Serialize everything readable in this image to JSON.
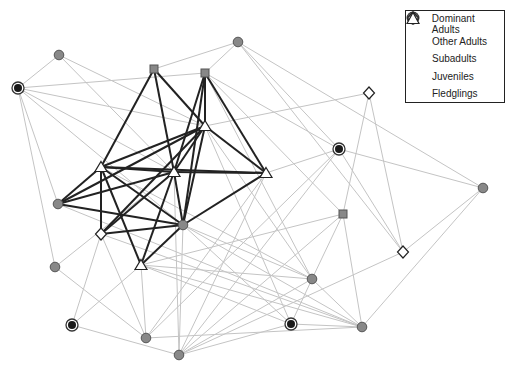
{
  "legend": {
    "items": [
      {
        "label": "Dominant Adults",
        "type": "dominant"
      },
      {
        "label": "Other Adults",
        "type": "adult"
      },
      {
        "label": "Subadults",
        "type": "subadult"
      },
      {
        "label": "Juveniles",
        "type": "juvenile"
      },
      {
        "label": "Fledglings",
        "type": "fledgling"
      }
    ]
  },
  "colors": {
    "node_fill": "#888888",
    "node_stroke": "#555555",
    "dominant_core": "#1a1a1a",
    "strong_edge": "#222222",
    "weak_edge": "#c4c4c4"
  },
  "nodes": [
    {
      "id": "A1",
      "type": "adult",
      "x": 59,
      "y": 55
    },
    {
      "id": "D1",
      "type": "dominant",
      "x": 18,
      "y": 88
    },
    {
      "id": "S1",
      "type": "subadult",
      "x": 154,
      "y": 69
    },
    {
      "id": "S2",
      "type": "subadult",
      "x": 205,
      "y": 73
    },
    {
      "id": "A2",
      "type": "adult",
      "x": 238,
      "y": 42
    },
    {
      "id": "F1",
      "type": "fledgling",
      "x": 205,
      "y": 126
    },
    {
      "id": "F2",
      "type": "fledgling",
      "x": 101,
      "y": 167
    },
    {
      "id": "F3",
      "type": "fledgling",
      "x": 174,
      "y": 172
    },
    {
      "id": "F4",
      "type": "fledgling",
      "x": 266,
      "y": 173
    },
    {
      "id": "A3",
      "type": "adult",
      "x": 58,
      "y": 204
    },
    {
      "id": "J1",
      "type": "juvenile",
      "x": 101,
      "y": 234
    },
    {
      "id": "A4",
      "type": "adult",
      "x": 183,
      "y": 225
    },
    {
      "id": "F5",
      "type": "fledgling",
      "x": 141,
      "y": 265
    },
    {
      "id": "A5",
      "type": "adult",
      "x": 55,
      "y": 267
    },
    {
      "id": "J2",
      "type": "juvenile",
      "x": 369,
      "y": 93
    },
    {
      "id": "D2",
      "type": "dominant",
      "x": 339,
      "y": 149
    },
    {
      "id": "S3",
      "type": "subadult",
      "x": 343,
      "y": 214
    },
    {
      "id": "J3",
      "type": "juvenile",
      "x": 403,
      "y": 252
    },
    {
      "id": "A6",
      "type": "adult",
      "x": 483,
      "y": 188
    },
    {
      "id": "A7",
      "type": "adult",
      "x": 312,
      "y": 279
    },
    {
      "id": "D3",
      "type": "dominant",
      "x": 72,
      "y": 325
    },
    {
      "id": "A8",
      "type": "adult",
      "x": 146,
      "y": 338
    },
    {
      "id": "A9",
      "type": "adult",
      "x": 179,
      "y": 355
    },
    {
      "id": "D4",
      "type": "dominant",
      "x": 291,
      "y": 324
    },
    {
      "id": "A10",
      "type": "adult",
      "x": 362,
      "y": 327
    }
  ],
  "strong_edges": [
    [
      "S1",
      "F2"
    ],
    [
      "S1",
      "F3"
    ],
    [
      "S1",
      "F1"
    ],
    [
      "S2",
      "F1"
    ],
    [
      "S2",
      "F4"
    ],
    [
      "S2",
      "F3"
    ],
    [
      "S2",
      "A4"
    ],
    [
      "F1",
      "F2"
    ],
    [
      "F1",
      "F3"
    ],
    [
      "F1",
      "F4"
    ],
    [
      "F1",
      "A3"
    ],
    [
      "F1",
      "J1"
    ],
    [
      "F1",
      "A4"
    ],
    [
      "F2",
      "F3"
    ],
    [
      "F2",
      "F4"
    ],
    [
      "F2",
      "A3"
    ],
    [
      "F2",
      "J1"
    ],
    [
      "F2",
      "A4"
    ],
    [
      "F2",
      "F5"
    ],
    [
      "F3",
      "F4"
    ],
    [
      "F3",
      "A3"
    ],
    [
      "F3",
      "A4"
    ],
    [
      "F3",
      "F5"
    ],
    [
      "F3",
      "J1"
    ],
    [
      "F4",
      "A4"
    ],
    [
      "A3",
      "A4"
    ],
    [
      "J1",
      "A4"
    ],
    [
      "A4",
      "F5"
    ]
  ],
  "weak_edges": [
    [
      "A1",
      "D1"
    ],
    [
      "A1",
      "F3"
    ],
    [
      "A1",
      "F1"
    ],
    [
      "D1",
      "S2"
    ],
    [
      "D1",
      "F1"
    ],
    [
      "D1",
      "F3"
    ],
    [
      "D1",
      "A3"
    ],
    [
      "D1",
      "A4"
    ],
    [
      "D1",
      "A5"
    ],
    [
      "S1",
      "A2"
    ],
    [
      "S2",
      "A2"
    ],
    [
      "S2",
      "D2"
    ],
    [
      "S2",
      "A7"
    ],
    [
      "S2",
      "S3"
    ],
    [
      "A2",
      "D2"
    ],
    [
      "A2",
      "J3"
    ],
    [
      "A2",
      "A6"
    ],
    [
      "F1",
      "J2"
    ],
    [
      "F1",
      "A7"
    ],
    [
      "F1",
      "D4"
    ],
    [
      "F4",
      "A9"
    ],
    [
      "F4",
      "A8"
    ],
    [
      "F4",
      "D2"
    ],
    [
      "J2",
      "S3"
    ],
    [
      "J2",
      "J3"
    ],
    [
      "D2",
      "A6"
    ],
    [
      "D2",
      "J3"
    ],
    [
      "D2",
      "A9"
    ],
    [
      "D2",
      "A8"
    ],
    [
      "S3",
      "F5"
    ],
    [
      "S3",
      "A9"
    ],
    [
      "S3",
      "A10"
    ],
    [
      "S3",
      "A7"
    ],
    [
      "J3",
      "A6"
    ],
    [
      "A6",
      "A10"
    ],
    [
      "J3",
      "A9"
    ],
    [
      "A5",
      "A8"
    ],
    [
      "A5",
      "F3"
    ],
    [
      "D3",
      "A9"
    ],
    [
      "D3",
      "F5"
    ],
    [
      "D3",
      "J1"
    ],
    [
      "A8",
      "F5"
    ],
    [
      "A8",
      "J1"
    ],
    [
      "A8",
      "A10"
    ],
    [
      "A9",
      "A7"
    ],
    [
      "A9",
      "D4"
    ],
    [
      "A9",
      "F3"
    ],
    [
      "A9",
      "A4"
    ],
    [
      "F5",
      "A7"
    ],
    [
      "F5",
      "D4"
    ],
    [
      "F5",
      "A10"
    ],
    [
      "A4",
      "A7"
    ],
    [
      "A4",
      "A10"
    ],
    [
      "A4",
      "D4"
    ],
    [
      "J1",
      "A10"
    ],
    [
      "A3",
      "A10"
    ],
    [
      "F2",
      "A7"
    ],
    [
      "A7",
      "A10"
    ],
    [
      "D4",
      "A10"
    ],
    [
      "A7",
      "D4"
    ]
  ]
}
